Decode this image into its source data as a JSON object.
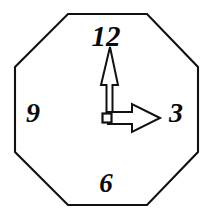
{
  "figure": {
    "shape": "octagon",
    "background_color": "#ffffff",
    "outline_color": "#111111",
    "numeral_color": "#0a0a0a",
    "hand_fill_color": "#ffffff",
    "hand_outline_color": "#111111"
  },
  "clock": {
    "time_shown": "3:00",
    "numerals": [
      {
        "label": "12",
        "position": "top",
        "x": 106,
        "y": 46
      },
      {
        "label": "3",
        "position": "right",
        "x": 176,
        "y": 122
      },
      {
        "label": "6",
        "position": "bottom",
        "x": 106,
        "y": 192
      },
      {
        "label": "9",
        "position": "left",
        "x": 33,
        "y": 122
      }
    ],
    "hands": {
      "minute": {
        "name": "minute-hand",
        "points_to": "12",
        "direction": "up",
        "style": "long-narrow-outlined-arrow",
        "tip_x": 110,
        "tip_y": 47
      },
      "hour": {
        "name": "hour-hand",
        "points_to": "3",
        "direction": "right",
        "style": "short-block-outlined-arrow",
        "tip_x": 160,
        "tip_y": 118
      }
    },
    "pivot": {
      "name": "center-pivot",
      "x": 107,
      "y": 118,
      "size": 9
    },
    "face_vertices": [
      {
        "x": 68,
        "y": 14
      },
      {
        "x": 147,
        "y": 14
      },
      {
        "x": 198,
        "y": 67
      },
      {
        "x": 198,
        "y": 152
      },
      {
        "x": 147,
        "y": 205
      },
      {
        "x": 68,
        "y": 205
      },
      {
        "x": 15,
        "y": 152
      },
      {
        "x": 15,
        "y": 67
      }
    ]
  }
}
